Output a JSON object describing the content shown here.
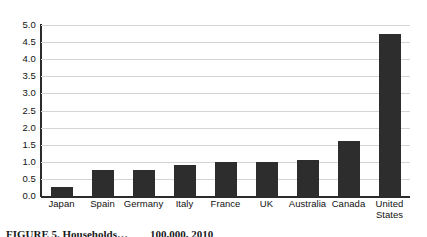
{
  "chart_data": {
    "type": "bar",
    "title": "",
    "subtitle": "",
    "xlabel": "",
    "ylabel": "",
    "grid": true,
    "legend": "none",
    "ylim": [
      0.0,
      5.0
    ],
    "ytick_step": 0.5,
    "ytick_labels": [
      "5.0",
      "4.5",
      "4.0",
      "3.5",
      "3.0",
      "2.5",
      "2.0",
      "1.5",
      "1.0",
      "0.5",
      "0.0"
    ],
    "ytick_values": [
      5.0,
      4.5,
      4.0,
      3.5,
      3.0,
      2.5,
      2.0,
      1.5,
      1.0,
      0.5,
      0.0
    ],
    "categories": [
      "Japan",
      "Spain",
      "Germany",
      "Italy",
      "France",
      "UK",
      "Australia",
      "Canada",
      "United States"
    ],
    "values": [
      0.25,
      0.75,
      0.75,
      0.9,
      1.0,
      1.0,
      1.05,
      1.6,
      4.75
    ],
    "bar_color": "#2d2d2d",
    "axis_color": "#2b2b2b",
    "grid_color": "#d4d4d4",
    "background": "#ffffff"
  },
  "caption": {
    "line": "FIGURE 5. Households…  100,000, 2010"
  }
}
